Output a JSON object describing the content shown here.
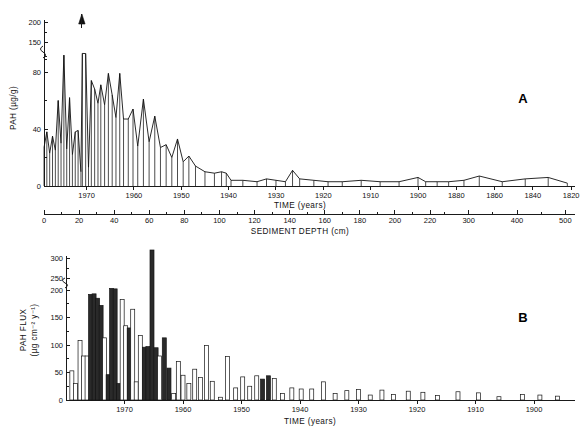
{
  "figure": {
    "panels": [
      {
        "letter": "A",
        "name": "pah-concentration-panel"
      },
      {
        "letter": "B",
        "name": "pah-flux-panel"
      }
    ]
  },
  "chart_data": [
    {
      "type": "area",
      "panel": "A",
      "title": "",
      "xlabel": "TIME (years)",
      "ylabel": "PAH  (µg/g)",
      "secondary_xlabel": "SEDIMENT DEPTH (cm)",
      "grid": false,
      "legend": null,
      "ylim": [
        0,
        200
      ],
      "ytick_labels": [
        "0",
        "40",
        "80",
        "150",
        "200"
      ],
      "yticks": [
        0,
        40,
        80,
        150,
        200
      ],
      "y_axis_break_between": [
        80,
        150
      ],
      "xtick_labels": [
        "1970",
        "1960",
        "1950",
        "1940",
        "1930",
        "1920",
        "1910",
        "1900",
        "1880",
        "1860",
        "1840",
        "1820"
      ],
      "secondary_xtick_labels": [
        "0",
        "20",
        "40",
        "60",
        "80",
        "100",
        "120",
        "140",
        "160",
        "180",
        "200",
        "220",
        "300",
        "400",
        "500"
      ],
      "annotations": [
        {
          "text": "off-scale arrow",
          "at_year": 1971,
          "symbol": "up-arrow"
        }
      ],
      "points": [
        {
          "year": 1979,
          "value": 27
        },
        {
          "year": 1978.4,
          "value": 38
        },
        {
          "year": 1977.8,
          "value": 23
        },
        {
          "year": 1977.2,
          "value": 35
        },
        {
          "year": 1976.6,
          "value": 25
        },
        {
          "year": 1976.0,
          "value": 60
        },
        {
          "year": 1975.4,
          "value": 30
        },
        {
          "year": 1974.8,
          "value": 128
        },
        {
          "year": 1974.2,
          "value": 26
        },
        {
          "year": 1973.6,
          "value": 62
        },
        {
          "year": 1973.0,
          "value": 22
        },
        {
          "year": 1972.4,
          "value": 38
        },
        {
          "year": 1971.8,
          "value": 39
        },
        {
          "year": 1971.2,
          "value": 10
        },
        {
          "year": 1970.9,
          "value": 140
        },
        {
          "year": 1970.2,
          "value": 139
        },
        {
          "year": 1969.6,
          "value": 13
        },
        {
          "year": 1969.0,
          "value": 74
        },
        {
          "year": 1968.3,
          "value": 68
        },
        {
          "year": 1967.6,
          "value": 58
        },
        {
          "year": 1967.0,
          "value": 71
        },
        {
          "year": 1966.2,
          "value": 57
        },
        {
          "year": 1965.4,
          "value": 79
        },
        {
          "year": 1964.6,
          "value": 64
        },
        {
          "year": 1963.8,
          "value": 48
        },
        {
          "year": 1963.0,
          "value": 79
        },
        {
          "year": 1962.2,
          "value": 47
        },
        {
          "year": 1961.2,
          "value": 47
        },
        {
          "year": 1960.2,
          "value": 54
        },
        {
          "year": 1959.2,
          "value": 28
        },
        {
          "year": 1958.0,
          "value": 61
        },
        {
          "year": 1956.8,
          "value": 31
        },
        {
          "year": 1955.6,
          "value": 49
        },
        {
          "year": 1954.4,
          "value": 27
        },
        {
          "year": 1953.2,
          "value": 29
        },
        {
          "year": 1952.0,
          "value": 20
        },
        {
          "year": 1950.8,
          "value": 33
        },
        {
          "year": 1949.6,
          "value": 17
        },
        {
          "year": 1948.4,
          "value": 21
        },
        {
          "year": 1947.0,
          "value": 14
        },
        {
          "year": 1945.0,
          "value": 10
        },
        {
          "year": 1943.0,
          "value": 9
        },
        {
          "year": 1941.5,
          "value": 10
        },
        {
          "year": 1940.5,
          "value": 9
        },
        {
          "year": 1939.5,
          "value": 4
        },
        {
          "year": 1937.0,
          "value": 4
        },
        {
          "year": 1934.0,
          "value": 3
        },
        {
          "year": 1932.0,
          "value": 5
        },
        {
          "year": 1930.0,
          "value": 4
        },
        {
          "year": 1928.0,
          "value": 3
        },
        {
          "year": 1926.5,
          "value": 11
        },
        {
          "year": 1925.0,
          "value": 5
        },
        {
          "year": 1922.0,
          "value": 4
        },
        {
          "year": 1919.0,
          "value": 3
        },
        {
          "year": 1916.0,
          "value": 3
        },
        {
          "year": 1912.0,
          "value": 4
        },
        {
          "year": 1908.0,
          "value": 3
        },
        {
          "year": 1904.0,
          "value": 3
        },
        {
          "year": 1900.0,
          "value": 6
        },
        {
          "year": 1896.0,
          "value": 3
        },
        {
          "year": 1890.0,
          "value": 3
        },
        {
          "year": 1884.0,
          "value": 3
        },
        {
          "year": 1876.0,
          "value": 4
        },
        {
          "year": 1868.0,
          "value": 7
        },
        {
          "year": 1856.0,
          "value": 3
        },
        {
          "year": 1844.0,
          "value": 5
        },
        {
          "year": 1832.0,
          "value": 6
        },
        {
          "year": 1822.0,
          "value": 2
        }
      ]
    },
    {
      "type": "bar",
      "panel": "B",
      "title": "",
      "xlabel": "TIME (years)",
      "ylabel": "PAH  FLUX (µg cm⁻² y⁻¹)",
      "grid": false,
      "legend": null,
      "ylim": [
        0,
        300
      ],
      "ytick_labels": [
        "0",
        "50",
        "100",
        "150",
        "200",
        "250",
        "300"
      ],
      "yticks": [
        0,
        50,
        100,
        150,
        200,
        250,
        300
      ],
      "y_axis_break_between": [
        200,
        250
      ],
      "xtick_labels": [
        "1970",
        "1960",
        "1950",
        "1940",
        "1930",
        "1920",
        "1910",
        "1900"
      ],
      "annotations": [
        {
          "text": "tall off-scale bar near 1965",
          "at_year": 1965,
          "value": 320
        }
      ],
      "bars": [
        {
          "year": 1979.0,
          "value": 53,
          "shade": "light"
        },
        {
          "year": 1978.4,
          "value": 30,
          "shade": "light"
        },
        {
          "year": 1977.6,
          "value": 108,
          "shade": "light"
        },
        {
          "year": 1977.0,
          "value": 80,
          "shade": "light"
        },
        {
          "year": 1976.4,
          "value": 80,
          "shade": "light"
        },
        {
          "year": 1975.8,
          "value": 192,
          "shade": "dark"
        },
        {
          "year": 1975.2,
          "value": 193,
          "shade": "dark"
        },
        {
          "year": 1974.6,
          "value": 185,
          "shade": "dark"
        },
        {
          "year": 1974.0,
          "value": 172,
          "shade": "dark"
        },
        {
          "year": 1973.4,
          "value": 113,
          "shade": "light"
        },
        {
          "year": 1972.8,
          "value": 46,
          "shade": "dark"
        },
        {
          "year": 1972.2,
          "value": 210,
          "shade": "dark"
        },
        {
          "year": 1971.6,
          "value": 207,
          "shade": "dark"
        },
        {
          "year": 1971.0,
          "value": 30,
          "shade": "dark"
        },
        {
          "year": 1970.4,
          "value": 183,
          "shade": "light"
        },
        {
          "year": 1969.8,
          "value": 135,
          "shade": "light"
        },
        {
          "year": 1969.2,
          "value": 131,
          "shade": "dark"
        },
        {
          "year": 1968.6,
          "value": 165,
          "shade": "light"
        },
        {
          "year": 1968.0,
          "value": 33,
          "shade": "light"
        },
        {
          "year": 1967.3,
          "value": 117,
          "shade": "light"
        },
        {
          "year": 1966.6,
          "value": 96,
          "shade": "dark"
        },
        {
          "year": 1966.0,
          "value": 97,
          "shade": "dark"
        },
        {
          "year": 1965.3,
          "value": 320,
          "shade": "dark"
        },
        {
          "year": 1964.6,
          "value": 95,
          "shade": "dark"
        },
        {
          "year": 1964.0,
          "value": 80,
          "shade": "light"
        },
        {
          "year": 1963.2,
          "value": 113,
          "shade": "dark"
        },
        {
          "year": 1962.4,
          "value": 58,
          "shade": "dark"
        },
        {
          "year": 1961.6,
          "value": 12,
          "shade": "light"
        },
        {
          "year": 1960.8,
          "value": 70,
          "shade": "light"
        },
        {
          "year": 1960.0,
          "value": 45,
          "shade": "light"
        },
        {
          "year": 1959.0,
          "value": 30,
          "shade": "light"
        },
        {
          "year": 1958.0,
          "value": 56,
          "shade": "light"
        },
        {
          "year": 1957.0,
          "value": 41,
          "shade": "light"
        },
        {
          "year": 1956.0,
          "value": 99,
          "shade": "light"
        },
        {
          "year": 1955.0,
          "value": 34,
          "shade": "light"
        },
        {
          "year": 1953.6,
          "value": 5,
          "shade": "light"
        },
        {
          "year": 1952.4,
          "value": 79,
          "shade": "light"
        },
        {
          "year": 1951.0,
          "value": 22,
          "shade": "light"
        },
        {
          "year": 1949.8,
          "value": 42,
          "shade": "light"
        },
        {
          "year": 1948.6,
          "value": 25,
          "shade": "light"
        },
        {
          "year": 1947.4,
          "value": 44,
          "shade": "light"
        },
        {
          "year": 1946.4,
          "value": 38,
          "shade": "dark"
        },
        {
          "year": 1945.4,
          "value": 44,
          "shade": "dark"
        },
        {
          "year": 1944.4,
          "value": 39,
          "shade": "light"
        },
        {
          "year": 1943.0,
          "value": 12,
          "shade": "light"
        },
        {
          "year": 1941.4,
          "value": 22,
          "shade": "light"
        },
        {
          "year": 1939.8,
          "value": 20,
          "shade": "light"
        },
        {
          "year": 1938.0,
          "value": 20,
          "shade": "light"
        },
        {
          "year": 1936.0,
          "value": 33,
          "shade": "light"
        },
        {
          "year": 1934.0,
          "value": 12,
          "shade": "light"
        },
        {
          "year": 1932.0,
          "value": 17,
          "shade": "light"
        },
        {
          "year": 1930.0,
          "value": 19,
          "shade": "light"
        },
        {
          "year": 1928.0,
          "value": 9,
          "shade": "light"
        },
        {
          "year": 1926.0,
          "value": 18,
          "shade": "light"
        },
        {
          "year": 1924.0,
          "value": 10,
          "shade": "light"
        },
        {
          "year": 1921.5,
          "value": 16,
          "shade": "light"
        },
        {
          "year": 1919.0,
          "value": 14,
          "shade": "light"
        },
        {
          "year": 1916.5,
          "value": 8,
          "shade": "light"
        },
        {
          "year": 1913.0,
          "value": 15,
          "shade": "light"
        },
        {
          "year": 1909.5,
          "value": 13,
          "shade": "light"
        },
        {
          "year": 1906.0,
          "value": 6,
          "shade": "light"
        },
        {
          "year": 1902.0,
          "value": 10,
          "shade": "light"
        },
        {
          "year": 1899.0,
          "value": 9,
          "shade": "light"
        },
        {
          "year": 1896.0,
          "value": 7,
          "shade": "light"
        }
      ]
    }
  ]
}
